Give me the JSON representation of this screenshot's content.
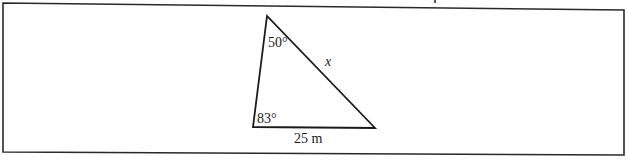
{
  "diagram": {
    "type": "triangle",
    "frame": {
      "stroke": "#2a2a2a"
    },
    "vertices": {
      "top": {
        "x": 267,
        "y": 16
      },
      "bottom_left": {
        "x": 253,
        "y": 127
      },
      "bottom_right": {
        "x": 375,
        "y": 128
      }
    },
    "labels": {
      "top_angle": "50°",
      "bottom_left_angle": "83°",
      "hypotenuse_side": "x",
      "base_side": "25 m"
    },
    "stroke_color": "#1a1a1a"
  }
}
